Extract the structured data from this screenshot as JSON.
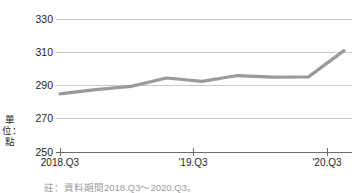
{
  "chart_data": {
    "type": "line",
    "title": "",
    "xlabel": "",
    "ylabel": "單位：點",
    "categories": [
      "2018.Q3",
      "2018.Q4",
      "2019.Q1",
      "2019.Q2",
      "2019.Q3",
      "2019.Q4",
      "2020.Q1",
      "2020.Q2",
      "2020.Q3"
    ],
    "x_tick_labels": [
      "2018.Q3",
      "'19.Q3",
      "'20.Q3"
    ],
    "x_tick_categories": [
      "2018.Q3",
      "2019.Q3",
      "2020.Q3"
    ],
    "values": [
      285.0,
      287.5,
      289.5,
      294.5,
      292.5,
      296.0,
      295.0,
      295.2,
      311.0
    ],
    "ylim": [
      250,
      330
    ],
    "y_ticks": [
      250,
      270,
      290,
      310,
      330
    ],
    "y_tick_labels": [
      "250",
      "270",
      "290",
      "310",
      "330"
    ],
    "grid": true,
    "legend": "none",
    "series_color": "#9a9a9a",
    "axis_color": "#6d6d6d",
    "grid_color": "#c9c9c9",
    "text_color": "#231f20"
  },
  "axis": {
    "unit_label": "單位：點"
  },
  "footnote": {
    "text": "註：資料期間2018.Q3～2020.Q3。"
  }
}
